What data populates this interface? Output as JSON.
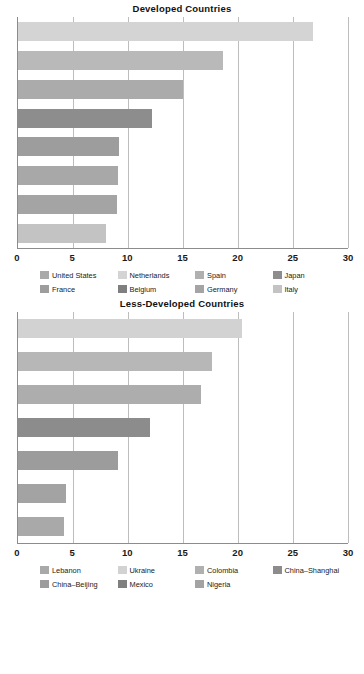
{
  "chart_data": [
    {
      "type": "bar",
      "orientation": "horizontal",
      "title": "Developed Countries",
      "xlabel": "",
      "ylabel": "",
      "xlim": [
        0,
        30
      ],
      "grid": true,
      "legend_position": "bottom",
      "ticks": [
        0,
        5,
        10,
        15,
        20,
        25,
        30
      ],
      "tick_labels": [
        "0",
        "5",
        "10",
        "15",
        "20",
        "25",
        "30"
      ],
      "categories": [
        "United States",
        "Netherlands",
        "Spain",
        "Japan",
        "France",
        "Belgium",
        "Germany",
        "Italy"
      ],
      "values": [
        26.8,
        18.6,
        15.0,
        12.2,
        9.2,
        9.1,
        9.0,
        8.0
      ],
      "colors": [
        "#d4d4d4",
        "#b9b9b9",
        "#ababab",
        "#8d8d8d",
        "#9d9d9d",
        "#a8a8a8",
        "#a4a4a4",
        "#c3c3c3"
      ]
    },
    {
      "type": "bar",
      "orientation": "horizontal",
      "title": "Less-Developed Countries",
      "xlabel": "",
      "ylabel": "",
      "xlim": [
        0,
        30
      ],
      "grid": true,
      "legend_position": "bottom",
      "ticks": [
        0,
        5,
        10,
        15,
        20,
        25,
        30
      ],
      "tick_labels": [
        "0",
        "5",
        "10",
        "15",
        "20",
        "25",
        "30"
      ],
      "categories": [
        "Lebanon",
        "Ukraine",
        "Colombia",
        "China-Shanghai",
        "China-Beijing",
        "Mexico",
        "Nigeria"
      ],
      "values": [
        20.4,
        17.6,
        16.6,
        12.0,
        9.1,
        4.4,
        4.2
      ],
      "colors": [
        "#d2d2d2",
        "#b7b7b7",
        "#adadad",
        "#8c8c8c",
        "#9c9c9c",
        "#a3a3a3",
        "#a9a9a9"
      ]
    }
  ],
  "legend_order": {
    "chart1": [
      {
        "label": "United States",
        "color": "#a9a9a9"
      },
      {
        "label": "Netherlands",
        "color": "#d4d4d4"
      },
      {
        "label": "Spain",
        "color": "#b0b0b0"
      },
      {
        "label": "Japan",
        "color": "#8d8d8d"
      },
      {
        "label": "France",
        "color": "#9d9d9d"
      },
      {
        "label": "Belgium",
        "color": "#7f7f7f"
      },
      {
        "label": "Germany",
        "color": "#a4a4a4"
      },
      {
        "label": "Italy",
        "color": "#c3c3c3"
      }
    ],
    "chart2": [
      {
        "label": "Lebanon",
        "color": "#a9a9a9"
      },
      {
        "label": "Ukraine",
        "color": "#d2d2d2"
      },
      {
        "label": "Colombia",
        "color": "#b0b0b0"
      },
      {
        "label": "China–Shanghai",
        "color": "#8c8c8c"
      },
      {
        "label": "China–Beijing",
        "color": "#9c9c9c"
      },
      {
        "label": "Mexico",
        "color": "#7f7f7f"
      },
      {
        "label": "Nigeria",
        "color": "#a3a3a3"
      }
    ]
  },
  "caption": ""
}
